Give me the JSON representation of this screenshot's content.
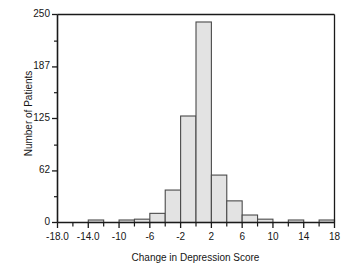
{
  "chart_data": {
    "type": "bar",
    "title": "",
    "xlabel": "Change in Depression Score",
    "ylabel": "Number of Patients",
    "xlim": [
      -18,
      18
    ],
    "ylim": [
      0,
      250
    ],
    "bin_width": 2,
    "grid": false,
    "legend": false,
    "x_tick_labels": [
      "-18.0",
      "-14.0",
      "-10",
      "-6",
      "-2",
      "2",
      "6",
      "10",
      "14",
      "18"
    ],
    "x_tick_values": [
      -18,
      -14,
      -10,
      -6,
      -2,
      2,
      6,
      10,
      14,
      18
    ],
    "x_minor_ticks": [
      -16,
      -12,
      -8,
      -4,
      0,
      4,
      8,
      12,
      16
    ],
    "y_tick_labels": [
      "0",
      "62",
      "125",
      "187",
      "250"
    ],
    "y_tick_values": [
      0,
      62,
      125,
      187,
      250
    ],
    "y_minor_ticks": [
      31,
      93,
      156,
      218
    ],
    "bar_fill": "#e3e3e3",
    "bar_stroke": "#4a4a4a",
    "axis_color": "#1a1a1a",
    "bins": [
      {
        "left": -18,
        "right": -16,
        "value": 0
      },
      {
        "left": -16,
        "right": -14,
        "value": 0
      },
      {
        "left": -14,
        "right": -12,
        "value": 3
      },
      {
        "left": -12,
        "right": -10,
        "value": 0
      },
      {
        "left": -10,
        "right": -8,
        "value": 3
      },
      {
        "left": -8,
        "right": -6,
        "value": 4
      },
      {
        "left": -6,
        "right": -4,
        "value": 11
      },
      {
        "left": -4,
        "right": -2,
        "value": 39
      },
      {
        "left": -2,
        "right": 0,
        "value": 128
      },
      {
        "left": 0,
        "right": 2,
        "value": 241
      },
      {
        "left": 2,
        "right": 4,
        "value": 57
      },
      {
        "left": 4,
        "right": 6,
        "value": 26
      },
      {
        "left": 6,
        "right": 8,
        "value": 9
      },
      {
        "left": 8,
        "right": 10,
        "value": 4
      },
      {
        "left": 10,
        "right": 12,
        "value": 0
      },
      {
        "left": 12,
        "right": 14,
        "value": 3
      },
      {
        "left": 14,
        "right": 16,
        "value": 0
      },
      {
        "left": 16,
        "right": 18,
        "value": 3
      }
    ]
  }
}
